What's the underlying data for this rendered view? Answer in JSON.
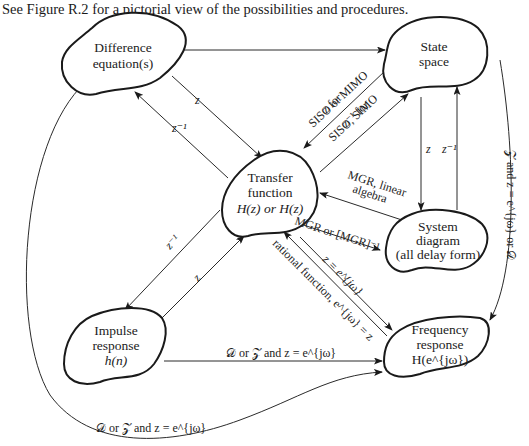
{
  "caption": "See Figure R.2 for a pictorial view of the possibilities and procedures.",
  "nodes": {
    "difference": {
      "line1": "Difference",
      "line2": "equation(s)"
    },
    "state": {
      "line1": "State",
      "line2": "space"
    },
    "transfer": {
      "line1": "Transfer",
      "line2": "function",
      "line3": "H(z) or H(z)"
    },
    "system": {
      "line1": "System",
      "line2": "diagram",
      "line3": "(all delay form)"
    },
    "impulse": {
      "line1": "Impulse",
      "line2": "response",
      "line3": "h(n)"
    },
    "frequency": {
      "line1": "Frequency",
      "line2": "response",
      "line3": "H(e^{jω})"
    }
  },
  "edges": {
    "diff_to_tf": "z",
    "tf_to_diff": "z⁻¹",
    "tf_to_state_a1": "z for",
    "tf_to_state_a2": "SISO or MIMO",
    "tf_to_state_b1": "z⁻¹ for",
    "tf_to_state_b2": "SISO, SIMO",
    "state_to_system": "z",
    "system_to_state": "z⁻¹",
    "system_to_tf_1": "MGR, linear",
    "system_to_tf_2": "algebra",
    "tf_to_system": "MGR or [MGR]⁻¹",
    "tf_to_freq": "z = e^{jω}",
    "freq_to_tf": "rational function, e^{jω} = z",
    "tf_to_impulse": "z⁻¹",
    "impulse_to_tf": "z",
    "impulse_to_freq": "𝒟 or 𝒵 and z = e^{jω}",
    "state_to_freq": "𝒵 and z = e^{jω} or 𝒟",
    "diff_to_freq": "𝒟 or 𝒵 and z = e^{jω}"
  }
}
